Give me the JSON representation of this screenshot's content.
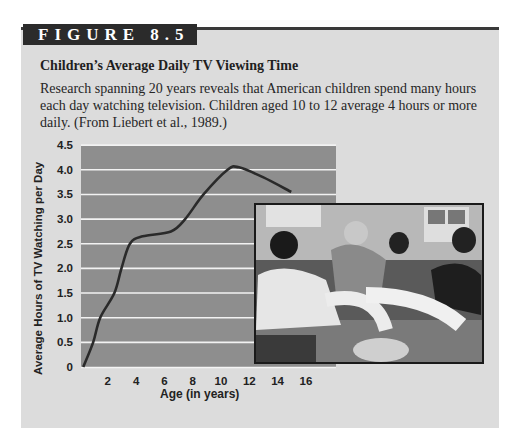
{
  "figure": {
    "label": "FIGURE 8.5",
    "title": "Children’s Average Daily TV Viewing Time",
    "caption": "Research spanning 20 years reveals that American children spend many hours each day watching television. Children aged 10 to 12 average 4 hours or more daily. (From Liebert et al., 1989.)"
  },
  "photo": {
    "description": "Photograph of five boys sitting on a couch watching television, with a bowl of snacks"
  },
  "chart_data": {
    "type": "line",
    "title": "Children’s Average Daily TV Viewing Time",
    "xlabel": "Age (in years)",
    "ylabel": "Average Hours of TV Watching per Day",
    "x_ticks": [
      "2",
      "4",
      "6",
      "8",
      "10",
      "12",
      "14",
      "16"
    ],
    "y_ticks": [
      "0",
      "0.5",
      "1.0",
      "1.5",
      "2.0",
      "2.5",
      "3.0",
      "3.5",
      "4.0",
      "4.5"
    ],
    "xlim": [
      0,
      17.5
    ],
    "ylim": [
      0,
      4.5
    ],
    "grid": "horizontal",
    "series": [
      {
        "name": "Average daily TV hours",
        "x": [
          0.3,
          1.0,
          1.5,
          2.5,
          3.0,
          3.6,
          4.5,
          6.5,
          7.5,
          8.8,
          10.5,
          11.3,
          13.0,
          15.0
        ],
        "values": [
          0.0,
          0.5,
          1.0,
          1.5,
          2.0,
          2.5,
          2.65,
          2.75,
          3.0,
          3.5,
          4.0,
          4.05,
          3.85,
          3.55
        ]
      }
    ]
  }
}
